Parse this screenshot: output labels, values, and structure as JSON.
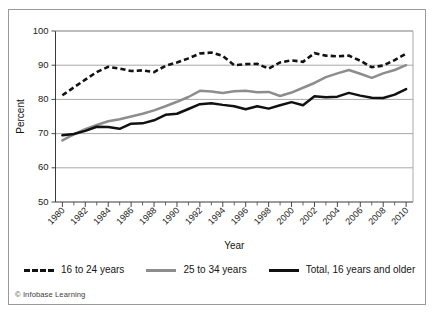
{
  "credit": "© Infobase Learning",
  "colors": {
    "series_16_24": "#121212",
    "series_25_34": "#8d8d8d",
    "series_total": "#111111",
    "grid": "#a8a8a8",
    "frame": "#9a9a9a",
    "text": "#1c1c1c"
  },
  "legend": {
    "items": [
      {
        "label": "16 to 24 years",
        "style": "dashed",
        "color": "#121212"
      },
      {
        "label": "25 to 34 years",
        "style": "solid",
        "color": "#8d8d8d"
      },
      {
        "label": "Total, 16 years and older",
        "style": "solid",
        "color": "#111111"
      }
    ]
  },
  "chart_data": {
    "type": "line",
    "title": "",
    "xlabel": "Year",
    "ylabel": "Percent",
    "xlim": [
      1979.4,
      2010.6
    ],
    "ylim": [
      50,
      100
    ],
    "yticks": [
      50,
      60,
      70,
      80,
      90,
      100
    ],
    "ytick_labels": [
      "50",
      "60",
      "70",
      "80",
      "90",
      "100"
    ],
    "xticks": [
      1980,
      1982,
      1984,
      1986,
      1988,
      1990,
      1992,
      1994,
      1996,
      1998,
      2000,
      2002,
      2004,
      2006,
      2008,
      2010
    ],
    "xtick_labels": [
      "1980",
      "1982",
      "1984",
      "1986",
      "1988",
      "1990",
      "1992",
      "1994",
      "1996",
      "1998",
      "2000",
      "2002",
      "2004",
      "2006",
      "2008",
      "2010"
    ],
    "x_minor_step": 1,
    "grid": "horizontal",
    "legend_position": "below",
    "x": [
      1980,
      1981,
      1982,
      1983,
      1984,
      1985,
      1986,
      1987,
      1988,
      1989,
      1990,
      1991,
      1992,
      1993,
      1994,
      1995,
      1996,
      1997,
      1998,
      1999,
      2000,
      2001,
      2002,
      2003,
      2004,
      2005,
      2006,
      2007,
      2008,
      2009,
      2010
    ],
    "series": [
      {
        "name": "16 to 24 years",
        "style": "dashed",
        "color": "#121212",
        "values": [
          81.2,
          83.5,
          85.8,
          88.0,
          89.5,
          89.0,
          88.3,
          88.5,
          88.0,
          89.8,
          90.8,
          92.0,
          93.4,
          93.7,
          92.7,
          90.0,
          90.3,
          90.4,
          89.0,
          90.8,
          91.4,
          91.0,
          93.5,
          92.8,
          92.6,
          92.8,
          91.3,
          89.4,
          89.9,
          91.5,
          93.4
        ]
      },
      {
        "name": "25 to 34 years",
        "style": "solid",
        "color": "#8d8d8d",
        "values": [
          68.0,
          69.8,
          71.3,
          72.5,
          73.6,
          74.2,
          75.0,
          75.8,
          76.8,
          78.0,
          79.3,
          80.7,
          82.5,
          82.3,
          81.9,
          82.4,
          82.5,
          82.1,
          82.2,
          81.0,
          82.0,
          83.4,
          84.8,
          86.5,
          87.6,
          88.6,
          87.5,
          86.3,
          87.6,
          88.6,
          90.0
        ]
      },
      {
        "name": "Total, 16 years and older",
        "style": "solid",
        "color": "#111111",
        "values": [
          69.5,
          69.9,
          70.8,
          72.0,
          71.9,
          71.4,
          72.9,
          73.0,
          73.9,
          75.5,
          75.8,
          77.2,
          78.6,
          78.9,
          78.4,
          78.0,
          77.1,
          78.0,
          77.3,
          78.3,
          79.2,
          78.3,
          80.9,
          80.6,
          80.8,
          81.9,
          81.1,
          80.5,
          80.4,
          81.4,
          83.0
        ]
      }
    ]
  },
  "axes": {
    "y_title": "Percent",
    "x_title": "Year"
  }
}
